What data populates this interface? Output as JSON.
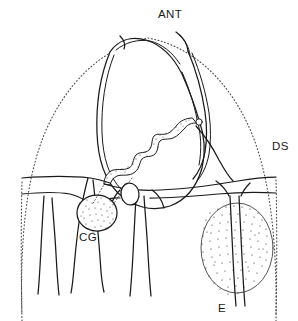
{
  "figure": {
    "background_color": "#ffffff",
    "ink_color": "#1a1a1a",
    "width": 298,
    "height": 321
  },
  "labels": {
    "ant": "ANT",
    "ds": "DS",
    "cg": "CG",
    "e": "E"
  },
  "label_positions": {
    "ant": {
      "x": 172,
      "y": 14
    },
    "ds": {
      "x": 280,
      "y": 146
    },
    "cg": {
      "x": 86,
      "y": 237
    },
    "e": {
      "x": 223,
      "y": 308
    }
  },
  "regions": [
    {
      "name": "outer-dotted-outline",
      "label": "",
      "style": "dotted",
      "description": "Large dome shaped dotted boundary spanning the figure"
    },
    {
      "name": "central-chamber",
      "label": "",
      "style": "double-contour",
      "description": "Large ovoid chamber occupying the upper centre"
    },
    {
      "name": "wavy-duct",
      "label": "",
      "style": "stippled-band",
      "description": "Narrow stippled sinuous duct descending to the left"
    },
    {
      "name": "small-node",
      "label": "",
      "style": "outline-circle",
      "description": "Small circular node on the right flank of the chamber"
    },
    {
      "name": "cg-body",
      "label": "CG",
      "style": "stippled-oval",
      "description": "Small finely stippled oval body labelled CG"
    },
    {
      "name": "plain-oval",
      "label": "",
      "style": "outline-oval",
      "description": "Small unshaded oval between the lower ducts"
    },
    {
      "name": "e-body",
      "label": "E",
      "style": "stippled-oval-large",
      "description": "Large coarsely stippled oval body labelled E, bisected by a vessel"
    }
  ]
}
